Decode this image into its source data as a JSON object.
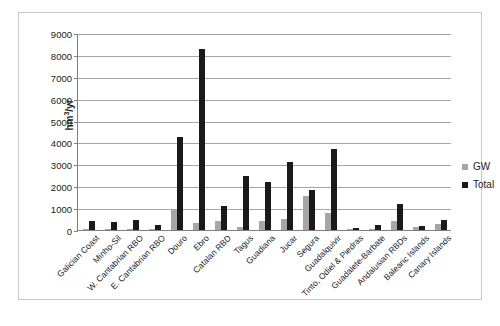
{
  "chart_data": {
    "type": "bar",
    "title": "",
    "xlabel": "",
    "ylabel": "hm3/yr",
    "ylabel_html": "hm³/yr",
    "ylim": [
      0,
      9000
    ],
    "ytick_step": 1000,
    "yticks": [
      0,
      1000,
      2000,
      3000,
      4000,
      5000,
      6000,
      7000,
      8000,
      9000
    ],
    "ytick_labels": [
      "0",
      "1000",
      "2000",
      "3000",
      "4000",
      "5000",
      "6000",
      "7000",
      "8000",
      "9000"
    ],
    "grid": true,
    "legend_position": "right",
    "categories": [
      "Galician Coast",
      "Minho-Sil",
      "W. Cantabrian RBO",
      "E. Cantabrian RBO",
      "Douro",
      "Ebro",
      "Catalan RBD",
      "Tagus",
      "Guadiana",
      "Jucar",
      "Segura",
      "Guadalquivir",
      "Tinto, Odiel & Piedras",
      "Guadalete-Barbate",
      "Andalusian RBDs",
      "Balearic Islands",
      "Canary Islands"
    ],
    "series": [
      {
        "name": "GW",
        "color": "#a6a6a6",
        "values": [
          30,
          20,
          25,
          15,
          900,
          300,
          420,
          120,
          430,
          490,
          1560,
          780,
          20,
          60,
          420,
          130,
          290
        ]
      },
      {
        "name": "Total",
        "color": "#1a1a1a",
        "values": [
          390,
          350,
          450,
          250,
          4250,
          8250,
          1100,
          2480,
          2180,
          3100,
          1840,
          3720,
          80,
          220,
          1180,
          200,
          480
        ]
      }
    ]
  },
  "legend": {
    "items": [
      {
        "label": "GW",
        "color": "#a6a6a6"
      },
      {
        "label": "Total",
        "color": "#1a1a1a"
      }
    ]
  }
}
